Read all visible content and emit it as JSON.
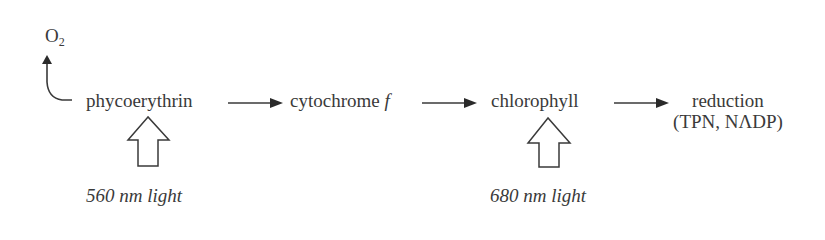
{
  "diagram": {
    "type": "flow",
    "nodes": [
      {
        "id": "o2",
        "text": "O",
        "subscript": "2"
      },
      {
        "id": "phycoerythrin",
        "text": "phycoerythrin"
      },
      {
        "id": "cytochrome",
        "text": "cytochrome ",
        "italic_suffix": "f"
      },
      {
        "id": "chlorophyll",
        "text": "chlorophyll"
      },
      {
        "id": "reduction",
        "line1": "reduction",
        "line2": "(TPN, NΛDP)"
      }
    ],
    "light_inputs": [
      {
        "target": "phycoerythrin",
        "label": "560 nm light"
      },
      {
        "target": "chlorophyll",
        "label": "680 nm light"
      }
    ],
    "edges": [
      {
        "from": "phycoerythrin",
        "to": "o2",
        "style": "curved"
      },
      {
        "from": "phycoerythrin",
        "to": "cytochrome",
        "style": "straight"
      },
      {
        "from": "cytochrome",
        "to": "chlorophyll",
        "style": "straight"
      },
      {
        "from": "chlorophyll",
        "to": "reduction",
        "style": "straight"
      }
    ],
    "colors": {
      "ink": "#3a3a3a",
      "background": "#ffffff"
    }
  }
}
